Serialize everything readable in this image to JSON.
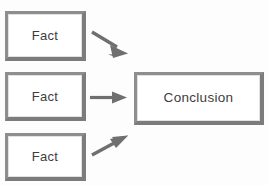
{
  "diagram": {
    "background_color": "#fdfdfd",
    "border_color": "#8e8e8e",
    "text_color": "#3d3d3d",
    "arrow_color": "#6f6f6f",
    "nodes": [
      {
        "id": "fact-1",
        "label": "Fact",
        "shape": "rectangle"
      },
      {
        "id": "fact-2",
        "label": "Fact",
        "shape": "rectangle"
      },
      {
        "id": "fact-3",
        "label": "Fact",
        "shape": "rectangle"
      },
      {
        "id": "conclusion",
        "label": "Conclusion",
        "shape": "rectangle"
      }
    ],
    "edges": [
      {
        "id": "edge-1",
        "from": "fact-1",
        "to": "conclusion",
        "style": "solid-arrow",
        "direction": "down-right"
      },
      {
        "id": "edge-2",
        "from": "fact-2",
        "to": "conclusion",
        "style": "solid-arrow",
        "direction": "right"
      },
      {
        "id": "edge-3",
        "from": "fact-3",
        "to": "conclusion",
        "style": "solid-arrow",
        "direction": "up-right"
      }
    ]
  }
}
